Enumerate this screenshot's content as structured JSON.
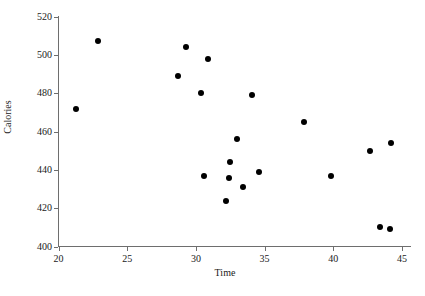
{
  "chart_data": {
    "type": "scatter",
    "title": "",
    "xlabel": "Time",
    "ylabel": "Calories",
    "xlim": [
      20,
      45
    ],
    "ylim": [
      400,
      520
    ],
    "xticks": [
      20,
      25,
      30,
      35,
      40,
      45
    ],
    "yticks": [
      400,
      420,
      440,
      460,
      480,
      500,
      520
    ],
    "grid": false,
    "legend": null,
    "marker": {
      "shape": "circle",
      "color": "#000000",
      "size": 6
    },
    "axis_color": "#6e6e6e",
    "points": [
      {
        "x": 21.3,
        "y": 472
      },
      {
        "x": 22.9,
        "y": 507
      },
      {
        "x": 28.7,
        "y": 489
      },
      {
        "x": 29.3,
        "y": 504
      },
      {
        "x": 30.4,
        "y": 480
      },
      {
        "x": 30.6,
        "y": 437
      },
      {
        "x": 30.9,
        "y": 498
      },
      {
        "x": 32.2,
        "y": 424
      },
      {
        "x": 32.4,
        "y": 436
      },
      {
        "x": 32.5,
        "y": 444
      },
      {
        "x": 33.0,
        "y": 456
      },
      {
        "x": 33.4,
        "y": 431
      },
      {
        "x": 34.1,
        "y": 479
      },
      {
        "x": 34.6,
        "y": 439
      },
      {
        "x": 37.9,
        "y": 465
      },
      {
        "x": 39.8,
        "y": 437
      },
      {
        "x": 42.7,
        "y": 450
      },
      {
        "x": 43.4,
        "y": 410
      },
      {
        "x": 44.1,
        "y": 409
      },
      {
        "x": 44.2,
        "y": 454
      }
    ]
  },
  "axes": {
    "x_title": "Time",
    "y_title": "Calories",
    "x_tick_labels": [
      "20",
      "25",
      "30",
      "35",
      "40",
      "45"
    ],
    "y_tick_labels": [
      "400",
      "420",
      "440",
      "460",
      "480",
      "500",
      "520"
    ]
  }
}
